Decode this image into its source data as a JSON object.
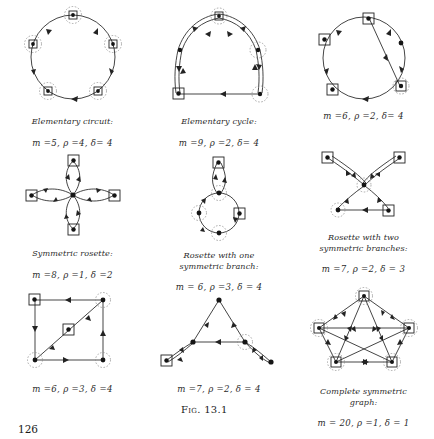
{
  "page": {
    "number": "126",
    "figure_label": "Fig. 13.1"
  },
  "figures": [
    {
      "id": "elementary-circuit",
      "title": "Elementary circuit:",
      "params": "m =5,  ρ =4,  δ= 4",
      "m": 5,
      "rho": 4,
      "delta": 4,
      "nodes": 5,
      "shape": "circle"
    },
    {
      "id": "elementary-cycle",
      "title": "Elementary cycle:",
      "params": "m =9,  ρ =2,  δ= 4",
      "m": 9,
      "rho": 2,
      "delta": 4,
      "nodes": 5,
      "shape": "cycle-double-edges"
    },
    {
      "id": "circuit-with-chord",
      "title": "",
      "params": "m =6,  ρ =2, δ= 4",
      "m": 6,
      "rho": 2,
      "delta": 4,
      "nodes": 6,
      "shape": "circle-with-chord"
    },
    {
      "id": "symmetric-rosette",
      "title": "Symmetric rosette:",
      "params": "m =8,  ρ =1,  δ =2",
      "m": 8,
      "rho": 1,
      "delta": 2,
      "nodes": 5,
      "shape": "four-petal-rosette"
    },
    {
      "id": "rosette-one-branch",
      "title": "Rosette with one\nsymmetric branch:",
      "params": "m = 6,  ρ =3,  δ = 4",
      "m": 6,
      "rho": 3,
      "delta": 4,
      "nodes": 5,
      "shape": "circle-with-lollipop"
    },
    {
      "id": "rosette-two-branches",
      "title": "Rosette with two\nsymmetric branches:",
      "params": "m =7,  ρ =2,  δ = 3",
      "m": 7,
      "rho": 2,
      "delta": 3,
      "nodes": 6,
      "shape": "two-branch-rosette"
    },
    {
      "id": "square-with-diagonal",
      "title": "",
      "params": "m =6,  ρ =3,  δ =4",
      "m": 6,
      "rho": 3,
      "delta": 4,
      "nodes": 5,
      "shape": "square-with-diagonal"
    },
    {
      "id": "tree-arborescence",
      "title": "",
      "params": "m =7,  ρ =2,  δ = 4",
      "m": 7,
      "rho": 2,
      "delta": 4,
      "nodes": 6,
      "shape": "arborescence"
    },
    {
      "id": "complete-symmetric-graph",
      "title": "Complete symmetric\ngraph:",
      "params": "m = 20, ρ =1, δ = 1",
      "m": 20,
      "rho": 1,
      "delta": 1,
      "nodes": 5,
      "shape": "complete-k5"
    }
  ]
}
